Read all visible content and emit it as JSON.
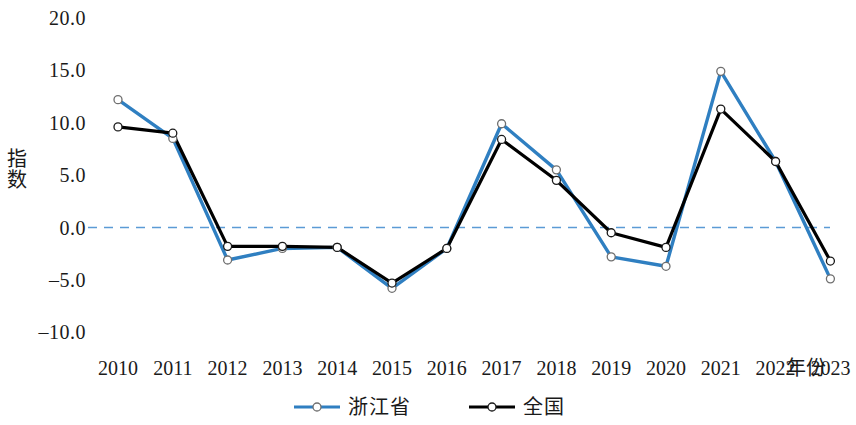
{
  "chart_data": {
    "type": "line",
    "title": "",
    "xlabel": "年份",
    "ylabel": "指数",
    "x": [
      2010,
      2011,
      2012,
      2013,
      2014,
      2015,
      2016,
      2017,
      2018,
      2019,
      2020,
      2021,
      2022,
      2023
    ],
    "categories": [
      "2010",
      "2011",
      "2012",
      "2013",
      "2014",
      "2015",
      "2016",
      "2017",
      "2018",
      "2019",
      "2020",
      "2021",
      "2022",
      "2023"
    ],
    "ylim": [
      -10.0,
      20.0
    ],
    "yticks": [
      20.0,
      15.0,
      10.0,
      5.0,
      0.0,
      -5.0,
      -10.0
    ],
    "ytick_labels": [
      "20.0",
      "15.0",
      "10.0",
      "5.0",
      "0.0",
      "–5.0",
      "–10.0"
    ],
    "grid": false,
    "zero_line": 0.0,
    "zero_line_style": "dashed",
    "zero_line_color": "#5b9bd5",
    "legend_position": "bottom-center",
    "marker": "open-circle",
    "series": [
      {
        "name": "浙江省",
        "color": "#2f7fc1",
        "values": [
          12.2,
          8.5,
          -3.1,
          -2.0,
          -1.9,
          -5.8,
          -2.0,
          9.9,
          5.5,
          -2.8,
          -3.7,
          14.9,
          6.3,
          -4.9
        ]
      },
      {
        "name": "全国",
        "color": "#000000",
        "values": [
          9.6,
          9.0,
          -1.8,
          -1.8,
          -1.9,
          -5.3,
          -2.0,
          8.4,
          4.5,
          -0.5,
          -1.9,
          11.3,
          6.3,
          -3.2
        ]
      }
    ]
  },
  "axes": {
    "y_title": "指数",
    "x_title": "年份"
  },
  "legend": {
    "items": [
      {
        "label": "浙江省",
        "color": "#2f7fc1"
      },
      {
        "label": "全国",
        "color": "#000000"
      }
    ]
  }
}
